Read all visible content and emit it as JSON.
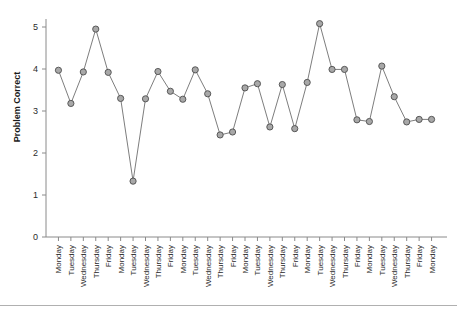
{
  "chart_data": {
    "type": "line",
    "title": "",
    "subtitle": "",
    "xlabel": "",
    "ylabel": "Problem Correct",
    "ylim": [
      0,
      5
    ],
    "yticks": [
      0,
      1,
      2,
      3,
      4,
      5
    ],
    "ytick_labels": [
      "0",
      "1",
      "2",
      "3",
      "4",
      "5"
    ],
    "grid": false,
    "legend": false,
    "legend_position": "none",
    "marker": "circle",
    "marker_facecolor": "#a8a8a8",
    "marker_edgecolor": "#4d4d4d",
    "line_color": "#6e6e6e",
    "categories": [
      "Monday",
      "Tuesday",
      "Wednesday",
      "Thursday",
      "Friday",
      "Monday",
      "Tuesday",
      "Wednesday",
      "Thursday",
      "Friday",
      "Monday",
      "Tuesday",
      "Wednesday",
      "Thursday",
      "Friday",
      "Monday",
      "Tuesday",
      "Wednesday",
      "Thursday",
      "Friday",
      "Monday",
      "Tuesday",
      "Wednesday",
      "Thursday",
      "Friday",
      "Monday",
      "Tuesday",
      "Wednesday",
      "Thursday",
      "Friday",
      "Monday"
    ],
    "values": [
      3.97,
      3.18,
      3.93,
      4.95,
      3.92,
      3.3,
      1.33,
      3.29,
      3.94,
      3.47,
      3.28,
      3.98,
      3.41,
      2.43,
      2.5,
      3.55,
      3.65,
      2.62,
      3.63,
      2.58,
      3.68,
      5.08,
      3.99,
      3.99,
      2.79,
      2.75,
      4.07,
      3.34,
      2.74,
      2.8,
      2.8
    ],
    "series": [
      {
        "name": "Problem Correct",
        "values": [
          3.97,
          3.18,
          3.93,
          4.95,
          3.92,
          3.3,
          1.33,
          3.29,
          3.94,
          3.47,
          3.28,
          3.98,
          3.41,
          2.43,
          2.5,
          3.55,
          3.65,
          2.62,
          3.63,
          2.58,
          3.68,
          5.08,
          3.99,
          3.99,
          2.79,
          2.75,
          4.07,
          3.34,
          2.74,
          2.8,
          2.8
        ]
      }
    ],
    "notes": {
      "max_value": 5.08,
      "max_category": "Tuesday",
      "min_value": 1.33,
      "min_category": "Tuesday",
      "point_count": 31
    }
  }
}
